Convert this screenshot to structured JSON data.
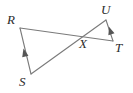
{
  "figure": {
    "type": "geometry-diagram",
    "background_color": "#ffffff",
    "stroke_color": "#7a7a7a",
    "label_color": "#2b2b2b"
  },
  "points": [
    {
      "id": "R",
      "label": "R",
      "x": 20,
      "y": 28,
      "label_x": 7,
      "label_y": 13
    },
    {
      "id": "S",
      "label": "S",
      "x": 31,
      "y": 74,
      "label_x": 19,
      "label_y": 75
    },
    {
      "id": "X",
      "label": "X",
      "x": 81,
      "y": 36,
      "label_x": 79,
      "label_y": 37
    },
    {
      "id": "U",
      "label": "U",
      "x": 106,
      "y": 20,
      "label_x": 101,
      "label_y": 3
    },
    {
      "id": "T",
      "label": "T",
      "x": 113,
      "y": 41,
      "label_x": 115,
      "label_y": 41
    }
  ],
  "segments": [
    {
      "id": "RT",
      "from": "R",
      "to": "T",
      "tick_marks": 0
    },
    {
      "id": "SU",
      "from": "S",
      "to": "U",
      "tick_marks": 0
    },
    {
      "id": "RS",
      "from": "R",
      "to": "S",
      "tick_marks": 1,
      "arrow_marker": "single-arrowhead"
    },
    {
      "id": "UT",
      "from": "U",
      "to": "T",
      "tick_marks": 1,
      "arrow_marker": "single-arrowhead"
    }
  ],
  "markers": [
    {
      "id": "arrow-rs",
      "on_segment": "RS",
      "x": 25,
      "y": 53,
      "rotation": -14,
      "kind": "single-arrowhead"
    },
    {
      "id": "arrow-ut",
      "on_segment": "UT",
      "x": 110,
      "y": 31,
      "rotation": -14,
      "kind": "single-arrowhead"
    }
  ]
}
